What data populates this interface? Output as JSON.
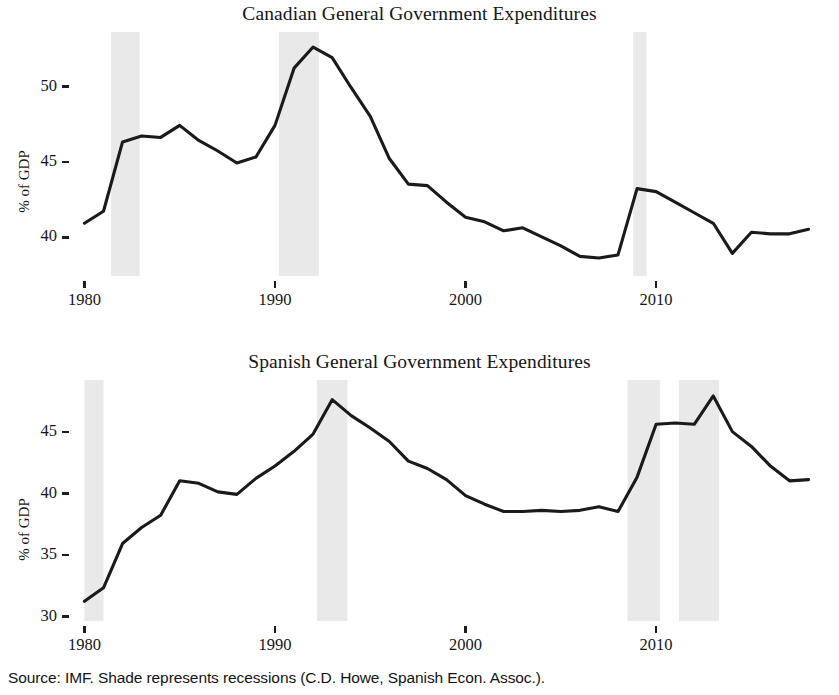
{
  "figure": {
    "source_note": "Source: IMF. Shade represents recessions (C.D. Howe, Spanish Econ. Assoc.).",
    "background_color": "#ffffff",
    "line_color": "#1a1a1a",
    "shade_color": "#e9e9e9"
  },
  "panels": [
    {
      "id": "canada",
      "title": "Canadian General Government Expenditures",
      "ylabel": "% of GDP",
      "yticks": [
        "40",
        "45",
        "50"
      ],
      "xticks": [
        "1980",
        "1990",
        "2000",
        "2010"
      ]
    },
    {
      "id": "spain",
      "title": "Spanish General Government Expenditures",
      "ylabel": "% of GDP",
      "yticks": [
        "30",
        "35",
        "40",
        "45"
      ],
      "xticks": [
        "1980",
        "1990",
        "2000",
        "2010"
      ]
    }
  ],
  "chart_data": [
    {
      "type": "line",
      "id": "canada",
      "title": "Canadian General Government Expenditures",
      "xlabel": "",
      "ylabel": "% of GDP",
      "xlim": [
        1979.4,
        2018.6
      ],
      "ylim": [
        37.4,
        53.6
      ],
      "xticks": [
        1980,
        1990,
        2000,
        2010
      ],
      "yticks": [
        40,
        45,
        50
      ],
      "grid": false,
      "legend": null,
      "x": [
        1980,
        1981,
        1982,
        1983,
        1984,
        1985,
        1986,
        1987,
        1988,
        1989,
        1990,
        1991,
        1992,
        1993,
        1994,
        1995,
        1996,
        1997,
        1998,
        1999,
        2000,
        2001,
        2002,
        2003,
        2004,
        2005,
        2006,
        2007,
        2008,
        2009,
        2010,
        2011,
        2012,
        2013,
        2014,
        2015,
        2016,
        2017,
        2018
      ],
      "values": [
        40.9,
        41.7,
        46.3,
        46.7,
        46.6,
        47.4,
        46.4,
        45.7,
        44.9,
        45.3,
        47.4,
        51.2,
        52.6,
        51.9,
        49.9,
        48.0,
        45.2,
        43.5,
        43.4,
        42.3,
        41.3,
        41.0,
        40.4,
        40.6,
        40.0,
        39.4,
        38.7,
        38.6,
        38.8,
        43.2,
        43.0,
        42.3,
        41.6,
        40.9,
        38.9,
        40.3,
        40.2,
        40.2,
        40.5
      ],
      "shaded_regions": [
        {
          "label": "recession",
          "start": 1981.4,
          "end": 1982.9
        },
        {
          "label": "recession",
          "start": 1990.2,
          "end": 1992.3
        },
        {
          "label": "recession",
          "start": 2008.8,
          "end": 2009.5
        }
      ]
    },
    {
      "type": "line",
      "id": "spain",
      "title": "Spanish General Government Expenditures",
      "xlabel": "",
      "ylabel": "% of GDP",
      "xlim": [
        1979.4,
        2018.6
      ],
      "ylim": [
        29.6,
        49.2
      ],
      "xticks": [
        1980,
        1990,
        2000,
        2010
      ],
      "yticks": [
        30,
        35,
        40,
        45
      ],
      "grid": false,
      "legend": null,
      "x": [
        1980,
        1981,
        1982,
        1983,
        1984,
        1985,
        1986,
        1987,
        1988,
        1989,
        1990,
        1991,
        1992,
        1993,
        1994,
        1995,
        1996,
        1997,
        1998,
        1999,
        2000,
        2001,
        2002,
        2003,
        2004,
        2005,
        2006,
        2007,
        2008,
        2009,
        2010,
        2011,
        2012,
        2013,
        2014,
        2015,
        2016,
        2017,
        2018
      ],
      "values": [
        31.2,
        32.3,
        35.9,
        37.2,
        38.2,
        41.0,
        40.8,
        40.1,
        39.9,
        41.2,
        42.2,
        43.4,
        44.8,
        47.6,
        46.3,
        45.3,
        44.2,
        42.6,
        42.0,
        41.1,
        39.8,
        39.1,
        38.5,
        38.5,
        38.6,
        38.5,
        38.6,
        38.9,
        38.5,
        41.3,
        45.6,
        45.7,
        45.6,
        47.9,
        45.0,
        43.8,
        42.2,
        41.0,
        41.1
      ],
      "shaded_regions": [
        {
          "label": "recession",
          "start": 1980.0,
          "end": 1981.0
        },
        {
          "label": "recession",
          "start": 1992.2,
          "end": 1993.8
        },
        {
          "label": "recession",
          "start": 2008.5,
          "end": 2010.2
        },
        {
          "label": "recession",
          "start": 2011.2,
          "end": 2013.3
        }
      ]
    }
  ]
}
